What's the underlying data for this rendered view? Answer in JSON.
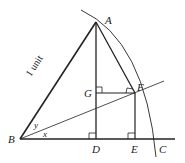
{
  "diagram": {
    "type": "geometry",
    "points": {
      "A": "A",
      "B": "B",
      "C": "C",
      "D": "D",
      "E": "E",
      "F": "F",
      "G": "G"
    },
    "angles": {
      "x": "x",
      "y": "y"
    },
    "side_label": "1 unit"
  }
}
